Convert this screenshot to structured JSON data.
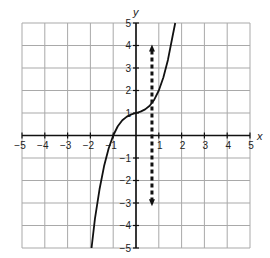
{
  "chart_data": {
    "type": "line",
    "title": "",
    "xlabel": "x",
    "ylabel": "y",
    "xlim": [
      -5,
      5
    ],
    "ylim": [
      -5,
      5
    ],
    "grid": true,
    "x_ticks": [
      -5,
      -4,
      -3,
      -2,
      -1,
      1,
      2,
      3,
      4,
      5
    ],
    "y_ticks": [
      -5,
      -4,
      -3,
      -2,
      -1,
      1,
      2,
      3,
      4,
      5
    ],
    "x_tick_labels": [
      "−5",
      "−4",
      "−3",
      "−2",
      "−1",
      "1",
      "2",
      "3",
      "4",
      "5"
    ],
    "y_tick_labels": [
      "−5",
      "−4",
      "−3",
      "−2",
      "−1",
      "1",
      "2",
      "3",
      "4",
      "5"
    ],
    "series": [
      {
        "name": "curve",
        "style": "solid",
        "color": "#111111",
        "description": "increasing cubic-like curve with inflection at (0, 1), passing through (-1, 0)",
        "x": [
          -1.95,
          -1.8,
          -1.6,
          -1.4,
          -1.2,
          -1.0,
          -0.8,
          -0.6,
          -0.4,
          -0.2,
          0.0,
          0.2,
          0.4,
          0.6,
          0.8,
          1.0,
          1.2,
          1.4,
          1.6,
          1.72
        ],
        "y": [
          -5.0,
          -3.69,
          -2.39,
          -1.36,
          -0.58,
          0.0,
          0.41,
          0.68,
          0.84,
          0.94,
          1.0,
          1.06,
          1.16,
          1.32,
          1.59,
          2.0,
          2.58,
          3.36,
          4.39,
          5.0
        ]
      },
      {
        "name": "vertical dashed line",
        "style": "dashed",
        "color": "#111111",
        "x": [
          0.7,
          0.7
        ],
        "y": [
          4.0,
          -3.1
        ],
        "arrows": "both"
      }
    ],
    "annotations": []
  }
}
